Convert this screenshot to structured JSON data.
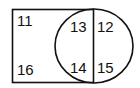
{
  "diagram": {
    "type": "venn",
    "shapes": [
      {
        "name": "rectangle",
        "label": ""
      },
      {
        "name": "circle",
        "label": ""
      }
    ],
    "regions": {
      "rect_top_left": "11",
      "rect_bottom_left": "16",
      "overlap_top": "13",
      "overlap_bottom": "14",
      "circle_only_top": "12",
      "circle_only_bottom": "15"
    },
    "colors": {
      "stroke": "#111111",
      "background": "#ffffff"
    }
  }
}
